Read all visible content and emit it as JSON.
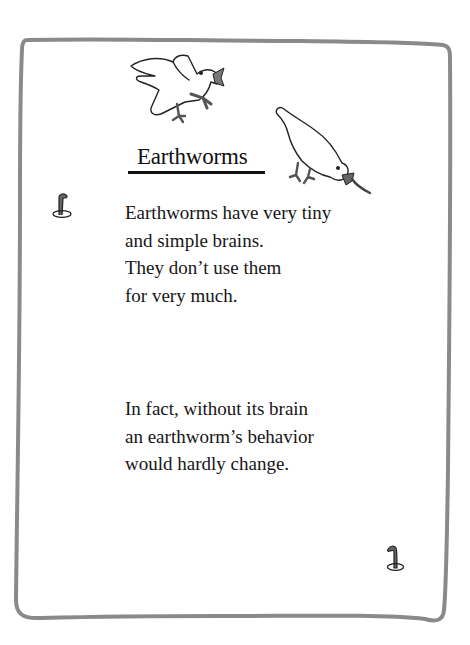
{
  "page": {
    "title": "Earthworms",
    "paragraphs": [
      {
        "lines": [
          "Earthworms have very tiny",
          "and simple brains.",
          "They don’t use them",
          "for very much."
        ]
      },
      {
        "lines": [
          "In fact, without its brain",
          "an earthworm’s behavior",
          "would hardly change."
        ]
      }
    ],
    "illustrations": [
      "flying-bird-with-worm-icon",
      "pecking-bird-pulling-worm-icon",
      "worm-icon-left",
      "worm-icon-bottom-right"
    ],
    "colors": {
      "border": "#8a8a8a",
      "text": "#161616",
      "background": "#ffffff"
    }
  }
}
